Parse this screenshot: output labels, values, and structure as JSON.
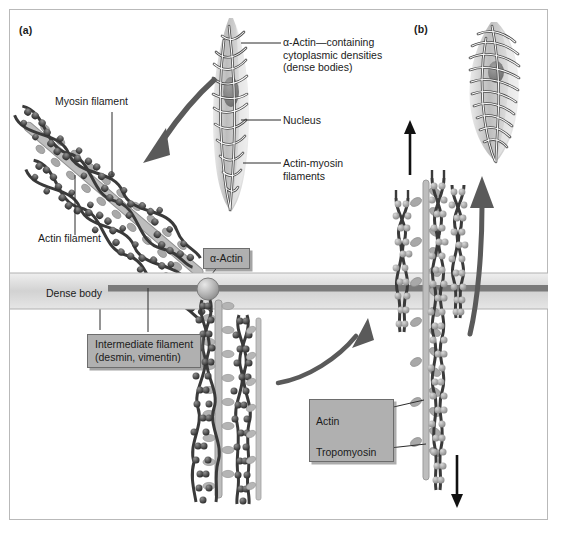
{
  "figure": {
    "panels": [
      {
        "tag": "(a)",
        "name": "relaxed-smooth-muscle-panel"
      },
      {
        "tag": "(b)",
        "name": "contracted-smooth-muscle-panel"
      }
    ]
  },
  "panel_a": {
    "leader_labels": [
      {
        "text_line1": "α-Actin—containing",
        "text_line2": "cytoplasmic densities",
        "text_line3": "(dense bodies)",
        "name": "alpha-actin-containing-cytoplasmic-densities-label"
      },
      {
        "text_line1": "Nucleus",
        "name": "nucleus-label"
      },
      {
        "text_line1": "Actin-myosin",
        "text_line2": "filaments",
        "name": "actin-myosin-filaments-label"
      }
    ],
    "plain_labels": [
      {
        "text": "Myosin filament",
        "name": "myosin-filament-label"
      },
      {
        "text": "Actin filament",
        "name": "actin-filament-label"
      },
      {
        "text": "Dense body",
        "name": "dense-body-label"
      }
    ],
    "boxed_labels": [
      {
        "text": "α-Actin",
        "name": "alpha-actin-callout"
      },
      {
        "line1": "Intermediate filament",
        "line2": "(desmin, vimentin)",
        "name": "intermediate-filament-callout"
      }
    ]
  },
  "panel_b": {
    "boxed_keys": [
      {
        "text": "Actin",
        "name": "actin-key-label"
      },
      {
        "text": "Tropomyosin",
        "name": "tropomyosin-key-label"
      }
    ],
    "arrows": [
      {
        "name": "contraction-arrow-up",
        "direction": "up"
      },
      {
        "name": "contraction-arrow-down",
        "direction": "down"
      },
      {
        "name": "curved-arrow-to-contracted-cell",
        "direction": "up-right"
      }
    ]
  },
  "colors": {
    "frame_border": "#b9b9b9",
    "callout_fill": "#b0b0b0",
    "callout_border": "#6d6d6d",
    "text": "#1b1b1b",
    "actin_dark": "#3a3a3a",
    "myosin_gray": "#a8a8a8",
    "dense_body_bar": "#7a7a7a",
    "dense_band": "#d8d8d8",
    "arrow_gray": "#5a5a5a"
  }
}
